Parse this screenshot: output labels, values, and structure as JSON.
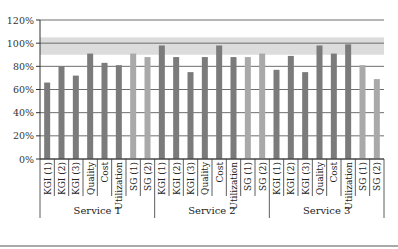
{
  "chart_data": {
    "type": "bar",
    "title": "",
    "xlabel": "",
    "ylabel": "",
    "ylim": [
      0,
      120
    ],
    "yticks": [
      "0%",
      "20%",
      "40%",
      "60%",
      "80%",
      "100%",
      "120%"
    ],
    "grid": true,
    "legend": null,
    "target_band": {
      "from": 90,
      "to": 105,
      "color": "#dcdcdc"
    },
    "groups": [
      {
        "name": "Service 1",
        "categories": [
          "KGI (1)",
          "KGI (2)",
          "KGI (3)",
          "Quality",
          "Cost",
          "Utilization",
          "SG (1)",
          "SG (2)"
        ],
        "values": [
          66,
          80,
          72,
          91,
          83,
          81,
          91,
          88
        ]
      },
      {
        "name": "Service 2",
        "categories": [
          "KGI (1)",
          "KGI (2)",
          "KGI (3)",
          "Quality",
          "Cost",
          "Utilization",
          "SG (1)",
          "SG (2)"
        ],
        "values": [
          98,
          88,
          75,
          88,
          98,
          88,
          88,
          91
        ]
      },
      {
        "name": "Service 3",
        "categories": [
          "KGI (1)",
          "KGI (2)",
          "KGI (3)",
          "Quality",
          "Cost",
          "Utilization",
          "SG (1)",
          "SG (2)"
        ],
        "values": [
          77,
          89,
          75,
          98,
          91,
          99,
          81,
          69
        ]
      }
    ],
    "colors": {
      "kpi": "#7b7b7b",
      "sg": "#a9a9a9",
      "grid": "#6e6e6e",
      "axis": "#333333"
    }
  }
}
